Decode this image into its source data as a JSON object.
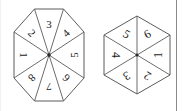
{
  "page": {
    "background_color": "#ffffff",
    "width": 189,
    "height": 111
  },
  "style": {
    "outline_color": "#5b5b5b",
    "spoke_color": "#5b5b5b",
    "hub_color": "#2b2b2b",
    "label_color": "#1a1a1a",
    "border_rule_color": "#8a8a8a"
  },
  "figures": [
    {
      "id": "octagon-spinner",
      "shape": "octagon",
      "sector_count": 8,
      "labels": [
        "1",
        "2",
        "3",
        "4",
        "5",
        "6",
        "7",
        "8"
      ],
      "sectors": [
        {
          "label": "1",
          "angle_deg": 180,
          "rotation_deg": 90
        },
        {
          "label": "2",
          "angle_deg": 135,
          "rotation_deg": 45
        },
        {
          "label": "3",
          "angle_deg": 90,
          "rotation_deg": 0
        },
        {
          "label": "4",
          "angle_deg": 45,
          "rotation_deg": -45
        },
        {
          "label": "5",
          "angle_deg": 0,
          "rotation_deg": -90
        },
        {
          "label": "6",
          "angle_deg": -45,
          "rotation_deg": -135
        },
        {
          "label": "7",
          "angle_deg": -90,
          "rotation_deg": 180
        },
        {
          "label": "8",
          "angle_deg": -135,
          "rotation_deg": 135
        }
      ]
    },
    {
      "id": "hexagon-spinner",
      "shape": "hexagon",
      "sector_count": 6,
      "labels": [
        "1",
        "2",
        "3",
        "4",
        "5",
        "6"
      ],
      "sectors": [
        {
          "label": "1",
          "angle_deg": 0,
          "rotation_deg": -90
        },
        {
          "label": "2",
          "angle_deg": -60,
          "rotation_deg": -150
        },
        {
          "label": "3",
          "angle_deg": -120,
          "rotation_deg": 150
        },
        {
          "label": "4",
          "angle_deg": 180,
          "rotation_deg": 90
        },
        {
          "label": "5",
          "angle_deg": 120,
          "rotation_deg": 30
        },
        {
          "label": "6",
          "angle_deg": 60,
          "rotation_deg": -30
        }
      ]
    }
  ],
  "rules": {
    "right_border": "vertical-divider",
    "left_border": "vertical-divider-faint"
  }
}
